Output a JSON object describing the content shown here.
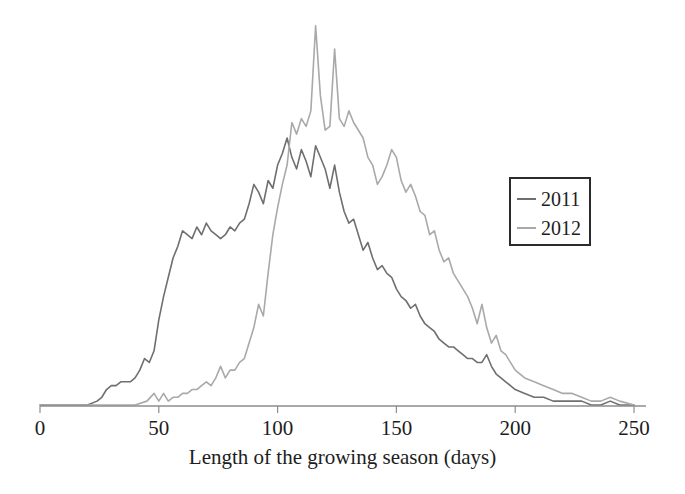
{
  "chart_data": {
    "type": "line",
    "title": "",
    "subtitle": "",
    "xlabel": "Length of the growing season (days)",
    "ylabel": "",
    "xlim": [
      0,
      250
    ],
    "ylim": [
      0,
      100
    ],
    "xticks": [
      0,
      50,
      100,
      150,
      200,
      250
    ],
    "xtick_labels": [
      "0",
      "50",
      "100",
      "150",
      "200",
      "250"
    ],
    "yticks": [],
    "ytick_labels": [],
    "grid": false,
    "legend_position": "right",
    "axis_line_color": "#8d8d8d",
    "series": [
      {
        "name": "2011",
        "color": "#6f6f6f",
        "x": [
          0,
          5,
          10,
          15,
          20,
          24,
          26,
          28,
          30,
          32,
          34,
          36,
          38,
          40,
          42,
          44,
          46,
          48,
          50,
          52,
          54,
          56,
          58,
          60,
          62,
          64,
          66,
          68,
          70,
          72,
          74,
          76,
          78,
          80,
          82,
          84,
          86,
          88,
          90,
          92,
          94,
          96,
          98,
          100,
          102,
          104,
          106,
          108,
          110,
          112,
          114,
          116,
          118,
          120,
          122,
          124,
          126,
          128,
          130,
          132,
          134,
          136,
          138,
          140,
          142,
          144,
          146,
          148,
          150,
          152,
          154,
          156,
          158,
          160,
          162,
          164,
          166,
          168,
          170,
          172,
          174,
          176,
          178,
          180,
          182,
          184,
          186,
          188,
          190,
          192,
          194,
          196,
          198,
          200,
          204,
          208,
          212,
          216,
          220,
          224,
          228,
          232,
          236,
          240,
          244,
          250
        ],
        "values": [
          0,
          0,
          0,
          0,
          0,
          1,
          2,
          4,
          5,
          5,
          6,
          6,
          6,
          7,
          9,
          12,
          11,
          14,
          22,
          28,
          33,
          38,
          41,
          45,
          44,
          43,
          46,
          44,
          47,
          45,
          44,
          43,
          44,
          46,
          45,
          47,
          48,
          52,
          57,
          55,
          52,
          58,
          56,
          62,
          65,
          69,
          64,
          61,
          66,
          63,
          59,
          67,
          64,
          61,
          56,
          62,
          55,
          50,
          47,
          48,
          44,
          40,
          42,
          38,
          35,
          36,
          34,
          33,
          30,
          28,
          27,
          25,
          26,
          23,
          21,
          20,
          19,
          17,
          16,
          15,
          15,
          14,
          13,
          12,
          12,
          11,
          11,
          13,
          10,
          8,
          7,
          6,
          5,
          4,
          3,
          2,
          2,
          1,
          1,
          1,
          1,
          0,
          0,
          1,
          0,
          0
        ]
      },
      {
        "name": "2012",
        "color": "#a9a9a9",
        "x": [
          0,
          5,
          10,
          15,
          20,
          25,
          30,
          35,
          40,
          45,
          48,
          50,
          52,
          54,
          56,
          58,
          60,
          62,
          64,
          66,
          68,
          70,
          72,
          74,
          76,
          78,
          80,
          82,
          84,
          86,
          88,
          90,
          92,
          94,
          96,
          98,
          100,
          102,
          104,
          106,
          108,
          110,
          112,
          114,
          116,
          118,
          120,
          122,
          124,
          126,
          128,
          130,
          132,
          134,
          136,
          138,
          140,
          142,
          144,
          146,
          148,
          150,
          152,
          154,
          156,
          158,
          160,
          162,
          164,
          166,
          168,
          170,
          172,
          174,
          176,
          178,
          180,
          182,
          184,
          186,
          188,
          190,
          192,
          194,
          196,
          198,
          200,
          204,
          208,
          212,
          216,
          220,
          224,
          228,
          232,
          236,
          240,
          244,
          250
        ],
        "values": [
          0,
          0,
          0,
          0,
          0,
          0,
          0,
          0,
          0,
          1,
          3,
          1,
          3,
          1,
          2,
          2,
          3,
          3,
          4,
          4,
          5,
          6,
          5,
          7,
          10,
          7,
          9,
          9,
          11,
          12,
          16,
          20,
          26,
          23,
          34,
          44,
          51,
          57,
          62,
          73,
          70,
          74,
          72,
          76,
          98,
          80,
          71,
          72,
          92,
          74,
          72,
          76,
          73,
          71,
          69,
          64,
          62,
          57,
          59,
          62,
          66,
          64,
          58,
          55,
          57,
          54,
          50,
          49,
          44,
          45,
          40,
          37,
          38,
          34,
          32,
          30,
          28,
          25,
          21,
          26,
          20,
          16,
          18,
          14,
          13,
          11,
          9,
          7,
          6,
          5,
          4,
          3,
          3,
          2,
          1,
          1,
          2,
          1,
          0
        ]
      }
    ]
  },
  "legend": {
    "items": [
      {
        "label": "2011",
        "color": "#6f6f6f"
      },
      {
        "label": "2012",
        "color": "#a9a9a9"
      }
    ]
  },
  "axis": {
    "title": "Length of the growing season (days)",
    "tick_labels": [
      "0",
      "50",
      "100",
      "150",
      "200",
      "250"
    ]
  }
}
